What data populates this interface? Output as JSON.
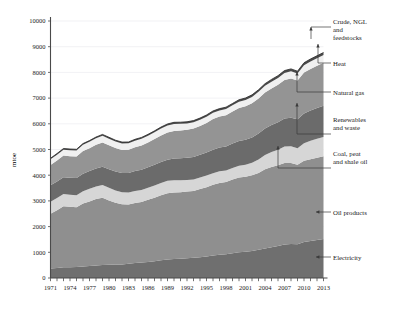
{
  "chart_data": {
    "type": "area",
    "title": "",
    "subtitle": "",
    "xlabel": "",
    "ylabel": "mtoe",
    "ylim": [
      0,
      10000
    ],
    "xlim": [
      1971,
      2013
    ],
    "grid": true,
    "legend_position": "right-callouts",
    "ytick_labels": [
      "0",
      "1000",
      "2000",
      "3000",
      "4000",
      "5000",
      "6000",
      "7000",
      "8000",
      "9000",
      "10000"
    ],
    "ytick_values": [
      0,
      1000,
      2000,
      3000,
      4000,
      5000,
      6000,
      7000,
      8000,
      9000,
      10000
    ],
    "xtick_labels": [
      "1971",
      "1974",
      "1977",
      "1980",
      "1983",
      "1986",
      "1989",
      "1992",
      "1995",
      "1998",
      "2001",
      "2004",
      "2007",
      "2010",
      "2013"
    ],
    "xtick_values": [
      1971,
      1974,
      1977,
      1980,
      1983,
      1986,
      1989,
      1992,
      1995,
      1998,
      2001,
      2004,
      2007,
      2010,
      2013
    ],
    "x": [
      1971,
      1972,
      1973,
      1974,
      1975,
      1976,
      1977,
      1978,
      1979,
      1980,
      1981,
      1982,
      1983,
      1984,
      1985,
      1986,
      1987,
      1988,
      1989,
      1990,
      1991,
      1992,
      1993,
      1994,
      1995,
      1996,
      1997,
      1998,
      1999,
      2000,
      2001,
      2002,
      2003,
      2004,
      2005,
      2006,
      2007,
      2008,
      2009,
      2010,
      2011,
      2012,
      2013
    ],
    "stack_order_bottom_to_top": [
      "Electricity",
      "Oil products",
      "Coal, peat and shale oil",
      "Renewables and waste",
      "Natural gas",
      "Heat",
      "Crude, NGL and feedstocks"
    ],
    "series": [
      {
        "name": "Electricity",
        "color": "#6f6f6f",
        "values": [
          370,
          390,
          415,
          420,
          425,
          450,
          470,
          490,
          510,
          515,
          525,
          530,
          550,
          580,
          605,
          625,
          655,
          690,
          715,
          735,
          750,
          765,
          785,
          810,
          840,
          875,
          900,
          925,
          960,
          1000,
          1020,
          1055,
          1100,
          1150,
          1195,
          1245,
          1300,
          1325,
          1315,
          1400,
          1440,
          1480,
          1520
        ]
      },
      {
        "name": "Oil products",
        "color": "#8f8f8f",
        "values": [
          2130,
          2250,
          2380,
          2350,
          2330,
          2450,
          2510,
          2580,
          2610,
          2500,
          2400,
          2340,
          2310,
          2340,
          2355,
          2420,
          2470,
          2530,
          2580,
          2590,
          2590,
          2600,
          2605,
          2650,
          2690,
          2750,
          2800,
          2810,
          2870,
          2910,
          2920,
          2945,
          2990,
          3080,
          3120,
          3140,
          3175,
          3145,
          3090,
          3165,
          3180,
          3200,
          3220
        ]
      },
      {
        "name": "Coal, peat and shale oil",
        "color": "#d6d6d6",
        "values": [
          470,
          470,
          475,
          470,
          465,
          480,
          490,
          495,
          500,
          495,
          480,
          470,
          465,
          470,
          465,
          470,
          475,
          480,
          485,
          480,
          465,
          450,
          445,
          450,
          455,
          455,
          455,
          450,
          450,
          455,
          465,
          480,
          520,
          555,
          585,
          610,
          640,
          655,
          645,
          680,
          720,
          735,
          745
        ]
      },
      {
        "name": "Renewables and waste",
        "color": "#6b6b6b",
        "values": [
          640,
          645,
          650,
          660,
          670,
          680,
          690,
          700,
          710,
          725,
          735,
          745,
          760,
          770,
          785,
          795,
          805,
          815,
          825,
          840,
          850,
          860,
          875,
          885,
          900,
          915,
          925,
          935,
          950,
          965,
          975,
          990,
          1010,
          1030,
          1050,
          1070,
          1090,
          1110,
          1130,
          1160,
          1180,
          1200,
          1220
        ]
      },
      {
        "name": "Natural gas",
        "color": "#949494",
        "values": [
          790,
          820,
          845,
          840,
          835,
          880,
          890,
          915,
          945,
          930,
          915,
          900,
          905,
          930,
          950,
          965,
          1000,
          1030,
          1055,
          1075,
          1085,
          1090,
          1105,
          1120,
          1150,
          1195,
          1200,
          1215,
          1245,
          1285,
          1300,
          1325,
          1365,
          1400,
          1425,
          1450,
          1500,
          1530,
          1500,
          1590,
          1615,
          1640,
          1670
        ]
      },
      {
        "name": "Heat",
        "color": "#f0f0f0",
        "values": [
          220,
          225,
          230,
          235,
          240,
          245,
          250,
          255,
          260,
          258,
          255,
          252,
          250,
          252,
          255,
          258,
          262,
          268,
          272,
          275,
          260,
          250,
          245,
          242,
          240,
          240,
          240,
          240,
          242,
          245,
          248,
          252,
          258,
          262,
          266,
          270,
          276,
          280,
          276,
          286,
          290,
          294,
          298
        ]
      },
      {
        "name": "Crude, NGL and feedstocks",
        "color": "#4a4a4a",
        "values": [
          40,
          42,
          44,
          44,
          44,
          46,
          48,
          50,
          52,
          52,
          52,
          52,
          53,
          54,
          55,
          56,
          58,
          60,
          62,
          63,
          63,
          64,
          65,
          66,
          68,
          70,
          71,
          72,
          74,
          76,
          77,
          79,
          81,
          84,
          86,
          88,
          91,
          92,
          91,
          95,
          97,
          99,
          101
        ]
      }
    ],
    "total_2013_approx": 8774,
    "total_1971_approx": 4660
  },
  "callouts": [
    {
      "name": "crude-ngl",
      "label_lines": [
        "Crude, NGL",
        "and",
        "feedstocks"
      ]
    },
    {
      "name": "heat",
      "label_lines": [
        "Heat"
      ]
    },
    {
      "name": "natural-gas",
      "label_lines": [
        "Natural gas"
      ]
    },
    {
      "name": "renewables",
      "label_lines": [
        "Renewables",
        "and waste"
      ]
    },
    {
      "name": "coal",
      "label_lines": [
        "Coal, peat",
        "and shale oil"
      ]
    },
    {
      "name": "oil",
      "label_lines": [
        "Oil products"
      ]
    },
    {
      "name": "electricity",
      "label_lines": [
        "Electricity"
      ]
    }
  ],
  "axis": {
    "y_title": "mtoe"
  }
}
